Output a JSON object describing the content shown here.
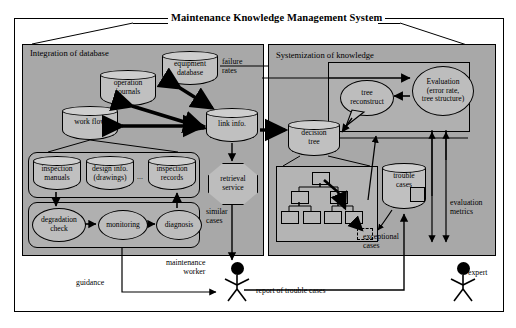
{
  "diagram": {
    "title": "Maintenance Knowledge Management System",
    "panels": {
      "left": {
        "label": "Integration of database"
      },
      "right": {
        "label": "Systemization of knowledge"
      }
    },
    "left_panel": {
      "databases": {
        "operation_journals": "operation\njournals",
        "equipment_database": "equipment\ndatabase",
        "work_flow": "work flow",
        "link_info": "link info.",
        "inspection_manuals": "inspection\nmanuals",
        "design_info": "design info.\n(drawings)",
        "ellipsis": "...",
        "inspection_records": "inspection\nrecords"
      },
      "processes": {
        "degradation_check": "degradation\ncheck",
        "monitoring": "monitoring",
        "diagnosis": "diagnosis",
        "retrieval_service": "retrieval\nservice"
      },
      "edge_labels": {
        "failure_rates": "failure\nrates",
        "similar_cases": "similar\ncases",
        "guidance": "guidance"
      }
    },
    "right_panel": {
      "nodes": {
        "tree_reconstruct": "tree\nreconstruct",
        "evaluation": "Evaluation\n(error rate,\ntree structure)",
        "decision_tree": "decision\ntree",
        "trouble_cases": "trouble\ncases"
      },
      "edge_labels": {
        "exceptional_cases": "exceptional\ncases",
        "evaluation_metrics": "evaluation\nmetrics"
      }
    },
    "actors": {
      "maintenance_worker": "maintenance\nworker",
      "expert": "expert"
    },
    "bottom_edge_labels": {
      "report_of_trouble_cases": "report of trouble cases"
    },
    "colors": {
      "panel_fill": "#a8a8a8",
      "subpanel_fill": "#b4b4b4",
      "shape_fill": "#c0c0c0",
      "stroke": "#000000",
      "page_bg": "#ffffff"
    }
  }
}
